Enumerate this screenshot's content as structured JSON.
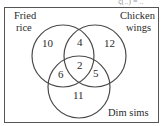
{
  "diagram": {
    "type": "venn-3",
    "header_cut_text": "ξ(..) = ..",
    "sets": [
      {
        "id": "fried_rice",
        "label_line1": "Fried",
        "label_line2": "rice"
      },
      {
        "id": "chicken_wings",
        "label_line1": "Chicken",
        "label_line2": "wings"
      },
      {
        "id": "dim_sims",
        "label_line1": "Dim sims"
      }
    ],
    "regions": {
      "fried_rice_only": "10",
      "chicken_wings_only": "12",
      "dim_sims_only": "11",
      "fried_rice_and_chicken_wings_only": "4",
      "fried_rice_and_dim_sims_only": "6",
      "chicken_wings_and_dim_sims_only": "5",
      "all_three": "2"
    },
    "colors": {
      "stroke": "#4a4a4a",
      "text": "#2a2a2a",
      "background": "#ffffff"
    }
  }
}
